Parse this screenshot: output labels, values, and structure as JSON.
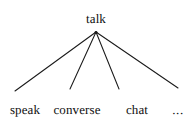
{
  "diagram": {
    "type": "tree",
    "kind": "hypernym-hyponym-taxonomy",
    "background_color": "#ffffff",
    "line_color": "#1a1a1a",
    "text_color": "#101010",
    "root": {
      "label": "talk",
      "x": 96,
      "y": 19,
      "apex_x": 96,
      "apex_y": 32
    },
    "children": [
      {
        "label": "speak",
        "x": 25,
        "y": 110,
        "edge_end_x": 15,
        "edge_end_y": 91
      },
      {
        "label": "converse",
        "x": 77,
        "y": 110,
        "edge_end_x": 70,
        "edge_end_y": 89
      },
      {
        "label": "chat",
        "x": 137,
        "y": 110,
        "edge_end_x": 119,
        "edge_end_y": 89
      },
      {
        "label": "...",
        "x": 178,
        "y": 110,
        "edge_end_x": 178,
        "edge_end_y": 88
      }
    ],
    "edges": [
      {
        "from": "talk",
        "to": "speak",
        "x1": 96,
        "y1": 32,
        "x2": 15,
        "y2": 91
      },
      {
        "from": "talk",
        "to": "converse",
        "x1": 96,
        "y1": 32,
        "x2": 70,
        "y2": 89
      },
      {
        "from": "talk",
        "to": "chat",
        "x1": 96,
        "y1": 32,
        "x2": 119,
        "y2": 89
      },
      {
        "from": "talk",
        "to": "...",
        "x1": 96,
        "y1": 32,
        "x2": 178,
        "y2": 88
      }
    ]
  }
}
